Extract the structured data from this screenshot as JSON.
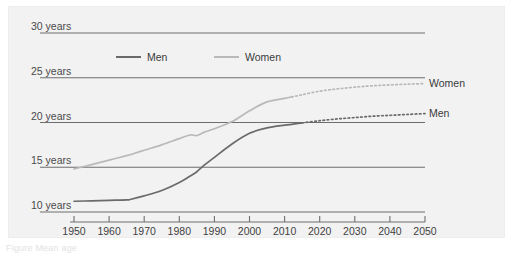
{
  "figure": {
    "caption": "Figure  Mean age",
    "background": "#f2f2f2",
    "page_background": "#ffffff"
  },
  "colors": {
    "men": "#6a6a6a",
    "women": "#b9b9b9",
    "gridline": "#6e6e6e",
    "axis": "#6e6e6e",
    "text": "#3f3f3f"
  },
  "legend": {
    "position": "top-inside",
    "entries": [
      {
        "label": "Men",
        "color": "#6a6a6a",
        "style": "solid"
      },
      {
        "label": "Women",
        "color": "#b9b9b9",
        "style": "solid"
      }
    ]
  },
  "end_labels": [
    {
      "label": "Women",
      "series": "women"
    },
    {
      "label": "Men",
      "series": "men"
    }
  ],
  "axes": {
    "y": {
      "ticks": [
        10,
        15,
        20,
        25,
        30
      ],
      "tick_labels": [
        "10 years",
        "15 years",
        "20 years",
        "25 years",
        "30 years"
      ],
      "min": 9.2,
      "max": 30.6,
      "grid": true
    },
    "x": {
      "ticks": [
        1950,
        1960,
        1970,
        1980,
        1990,
        2000,
        2010,
        2020,
        2030,
        2040,
        2050
      ],
      "tick_labels": [
        "1950",
        "1960",
        "1970",
        "1980",
        "1990",
        "2000",
        "2010",
        "2020",
        "2030",
        "2040",
        "2050"
      ],
      "min": 1946,
      "max": 2053,
      "grid": false
    }
  },
  "chart_data": {
    "type": "line",
    "title": "",
    "subtitle": "",
    "xlabel": "",
    "ylabel": "years",
    "xlim": [
      1946,
      2053
    ],
    "ylim": [
      9.2,
      30.6
    ],
    "grid": true,
    "legend_position": "top-inside",
    "x": [
      1950,
      1955,
      1960,
      1965,
      1966,
      1970,
      1975,
      1980,
      1983,
      1985,
      1987,
      1990,
      1995,
      2000,
      2005,
      2010,
      2012,
      2015,
      2020,
      2025,
      2030,
      2035,
      2040,
      2045,
      2050
    ],
    "series": [
      {
        "name": "Men",
        "color": "#6a6a6a",
        "solid_until": 2015,
        "projection_style": "dotted",
        "values": [
          11.2,
          11.25,
          11.3,
          11.35,
          11.4,
          11.8,
          12.4,
          13.3,
          14.0,
          14.5,
          15.2,
          16.1,
          17.6,
          18.8,
          19.4,
          19.7,
          19.8,
          19.95,
          20.2,
          20.4,
          20.55,
          20.7,
          20.8,
          20.9,
          21.0
        ]
      },
      {
        "name": "Women",
        "color": "#b9b9b9",
        "solid_until": 2012,
        "projection_style": "dotted",
        "values": [
          14.8,
          15.3,
          15.8,
          16.3,
          16.4,
          16.9,
          17.5,
          18.2,
          18.6,
          18.55,
          18.9,
          19.3,
          20.1,
          21.3,
          22.3,
          22.7,
          22.85,
          23.1,
          23.5,
          23.75,
          23.95,
          24.1,
          24.2,
          24.28,
          24.35
        ]
      }
    ],
    "annotations": [
      {
        "text": "Women",
        "at_x": 2050,
        "at_y": 24.35,
        "placement": "right"
      },
      {
        "text": "Men",
        "at_x": 2050,
        "at_y": 21.0,
        "placement": "right"
      }
    ]
  }
}
